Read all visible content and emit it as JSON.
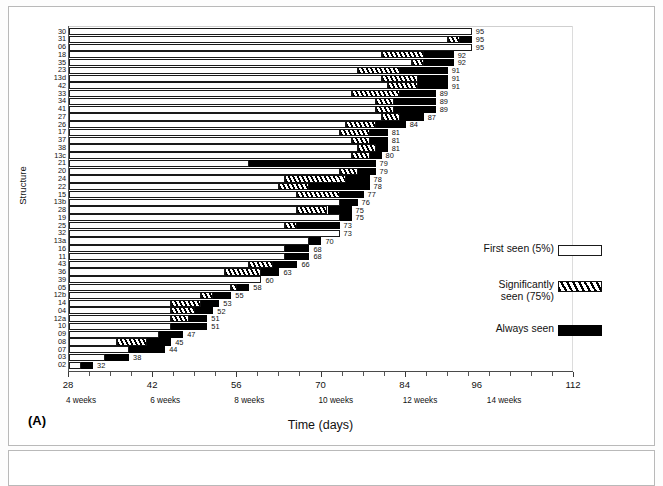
{
  "figure": {
    "panel_tag": "(A)",
    "xtitle": "Time (days)",
    "ytitle": "Structure"
  },
  "legend": {
    "items": [
      {
        "label": "First seen (5%)",
        "swatch": "white-open-box"
      },
      {
        "label": "Significantly\nseen (75%)",
        "swatch": "diagonal-hatch-box"
      },
      {
        "label": "Always seen",
        "swatch": "solid-black-box"
      }
    ]
  },
  "chart_data": {
    "type": "bar",
    "orientation": "horizontal",
    "title": "",
    "subtitle": "",
    "xlabel": "Time (days)",
    "ylabel": "Structure",
    "xlim": [
      28,
      112
    ],
    "ylim": null,
    "grid": false,
    "legend_position": "inside-right",
    "x_major_ticks": [
      28,
      42,
      56,
      70,
      84,
      96,
      112
    ],
    "x_tick_labels": [
      "28",
      "42",
      "56",
      "70",
      "84",
      "96",
      "112"
    ],
    "x_minor_tick_step": 3.5,
    "x_week_annotations": [
      {
        "value": 28,
        "label": "4 weeks"
      },
      {
        "value": 42,
        "label": "6 weeks"
      },
      {
        "value": 56,
        "label": "8 weeks"
      },
      {
        "value": 70,
        "label": "10 weeks"
      },
      {
        "value": 84,
        "label": "12 weeks"
      },
      {
        "value": 98,
        "label": "14 weeks"
      }
    ],
    "series": [
      {
        "name": "First seen (5%)",
        "style": "white-open"
      },
      {
        "name": "Significantly seen (75%)",
        "style": "diagonal-hatch"
      },
      {
        "name": "Always seen",
        "style": "solid-black"
      }
    ],
    "categories": [
      "30",
      "31",
      "06",
      "18",
      "35",
      "23",
      "13d",
      "42",
      "33",
      "34",
      "41",
      "27",
      "26",
      "17",
      "37",
      "38",
      "13c",
      "21",
      "20",
      "24",
      "22",
      "15",
      "13b",
      "28",
      "19",
      "25",
      "32",
      "13a",
      "16",
      "11",
      "43",
      "36",
      "39",
      "05",
      "12b",
      "14",
      "04",
      "12a",
      "10",
      "09",
      "08",
      "07",
      "03",
      "02"
    ],
    "rows": [
      {
        "structure": "30",
        "first_seen": 28,
        "significantly_seen": 95,
        "always_seen": 95,
        "end": 95,
        "label": "95"
      },
      {
        "structure": "31",
        "first_seen": 28,
        "significantly_seen": 91,
        "always_seen": 93,
        "end": 95,
        "label": "95"
      },
      {
        "structure": "06",
        "first_seen": 28,
        "significantly_seen": 95,
        "always_seen": 95,
        "end": 95,
        "label": "95"
      },
      {
        "structure": "18",
        "first_seen": 28,
        "significantly_seen": 80,
        "always_seen": 87,
        "end": 92,
        "label": "92"
      },
      {
        "structure": "35",
        "first_seen": 28,
        "significantly_seen": 85,
        "always_seen": 87,
        "end": 92,
        "label": "92"
      },
      {
        "structure": "23",
        "first_seen": 28,
        "significantly_seen": 76,
        "always_seen": 83,
        "end": 91,
        "label": "91"
      },
      {
        "structure": "13d",
        "first_seen": 28,
        "significantly_seen": 80,
        "always_seen": 86,
        "end": 91,
        "label": "91"
      },
      {
        "structure": "42",
        "first_seen": 28,
        "significantly_seen": 81,
        "always_seen": 86,
        "end": 91,
        "label": "91"
      },
      {
        "structure": "33",
        "first_seen": 28,
        "significantly_seen": 75,
        "always_seen": 83,
        "end": 89,
        "label": "89"
      },
      {
        "structure": "34",
        "first_seen": 28,
        "significantly_seen": 79,
        "always_seen": 82,
        "end": 89,
        "label": "89"
      },
      {
        "structure": "41",
        "first_seen": 28,
        "significantly_seen": 79,
        "always_seen": 82,
        "end": 89,
        "label": "89"
      },
      {
        "structure": "27",
        "first_seen": 28,
        "significantly_seen": 80,
        "always_seen": 83,
        "end": 87,
        "label": "87"
      },
      {
        "structure": "26",
        "first_seen": 28,
        "significantly_seen": 74,
        "always_seen": 79,
        "end": 84,
        "label": "84"
      },
      {
        "structure": "17",
        "first_seen": 28,
        "significantly_seen": 73,
        "always_seen": 78,
        "end": 81,
        "label": "81"
      },
      {
        "structure": "37",
        "first_seen": 28,
        "significantly_seen": 75,
        "always_seen": 78,
        "end": 81,
        "label": "81"
      },
      {
        "structure": "38",
        "first_seen": 28,
        "significantly_seen": 76,
        "always_seen": 79,
        "end": 81,
        "label": "81"
      },
      {
        "structure": "13c",
        "first_seen": 28,
        "significantly_seen": 75,
        "always_seen": 78,
        "end": 80,
        "label": "80"
      },
      {
        "structure": "21",
        "first_seen": 28,
        "significantly_seen": 58,
        "always_seen": 58,
        "end": 79,
        "label": "79"
      },
      {
        "structure": "20",
        "first_seen": 28,
        "significantly_seen": 73,
        "always_seen": 76,
        "end": 79,
        "label": "79"
      },
      {
        "structure": "24",
        "first_seen": 28,
        "significantly_seen": 64,
        "always_seen": 74,
        "end": 78,
        "label": "78"
      },
      {
        "structure": "22",
        "first_seen": 28,
        "significantly_seen": 63,
        "always_seen": 68,
        "end": 78,
        "label": "78"
      },
      {
        "structure": "15",
        "first_seen": 28,
        "significantly_seen": 66,
        "always_seen": 73,
        "end": 77,
        "label": "77"
      },
      {
        "structure": "13b",
        "first_seen": 28,
        "significantly_seen": 73,
        "always_seen": 73,
        "end": 76,
        "label": "76"
      },
      {
        "structure": "28",
        "first_seen": 28,
        "significantly_seen": 66,
        "always_seen": 71,
        "end": 75,
        "label": "75"
      },
      {
        "structure": "19",
        "first_seen": 28,
        "significantly_seen": 73,
        "always_seen": 73,
        "end": 75,
        "label": "75"
      },
      {
        "structure": "25",
        "first_seen": 28,
        "significantly_seen": 64,
        "always_seen": 66,
        "end": 73,
        "label": "73"
      },
      {
        "structure": "32",
        "first_seen": 28,
        "significantly_seen": 73,
        "always_seen": 73,
        "end": 73,
        "label": "73"
      },
      {
        "structure": "13a",
        "first_seen": 28,
        "significantly_seen": 68,
        "always_seen": 68,
        "end": 70,
        "label": "70"
      },
      {
        "structure": "16",
        "first_seen": 28,
        "significantly_seen": 64,
        "always_seen": 64,
        "end": 68,
        "label": "68"
      },
      {
        "structure": "11",
        "first_seen": 28,
        "significantly_seen": 64,
        "always_seen": 64,
        "end": 68,
        "label": "68"
      },
      {
        "structure": "43",
        "first_seen": 28,
        "significantly_seen": 58,
        "always_seen": 62,
        "end": 66,
        "label": "66"
      },
      {
        "structure": "36",
        "first_seen": 28,
        "significantly_seen": 54,
        "always_seen": 60,
        "end": 63,
        "label": "63"
      },
      {
        "structure": "39",
        "first_seen": 28,
        "significantly_seen": 60,
        "always_seen": 60,
        "end": 60,
        "label": "60"
      },
      {
        "structure": "05",
        "first_seen": 28,
        "significantly_seen": 55,
        "always_seen": 56,
        "end": 58,
        "label": "58"
      },
      {
        "structure": "12b",
        "first_seen": 28,
        "significantly_seen": 50,
        "always_seen": 52,
        "end": 55,
        "label": "55"
      },
      {
        "structure": "14",
        "first_seen": 28,
        "significantly_seen": 45,
        "always_seen": 50,
        "end": 53,
        "label": "53"
      },
      {
        "structure": "04",
        "first_seen": 28,
        "significantly_seen": 45,
        "always_seen": 49,
        "end": 52,
        "label": "52"
      },
      {
        "structure": "12a",
        "first_seen": 28,
        "significantly_seen": 45,
        "always_seen": 48,
        "end": 51,
        "label": "51"
      },
      {
        "structure": "10",
        "first_seen": 28,
        "significantly_seen": 45,
        "always_seen": 45,
        "end": 51,
        "label": "51"
      },
      {
        "structure": "09",
        "first_seen": 28,
        "significantly_seen": 43,
        "always_seen": 43,
        "end": 47,
        "label": "47"
      },
      {
        "structure": "08",
        "first_seen": 28,
        "significantly_seen": 36,
        "always_seen": 41,
        "end": 45,
        "label": "45"
      },
      {
        "structure": "07",
        "first_seen": 28,
        "significantly_seen": 38,
        "always_seen": 38,
        "end": 44,
        "label": "44"
      },
      {
        "structure": "03",
        "first_seen": 28,
        "significantly_seen": 34,
        "always_seen": 34,
        "end": 38,
        "label": "38"
      },
      {
        "structure": "02",
        "first_seen": 28,
        "significantly_seen": 30,
        "always_seen": 30,
        "end": 32,
        "label": "32"
      }
    ]
  }
}
